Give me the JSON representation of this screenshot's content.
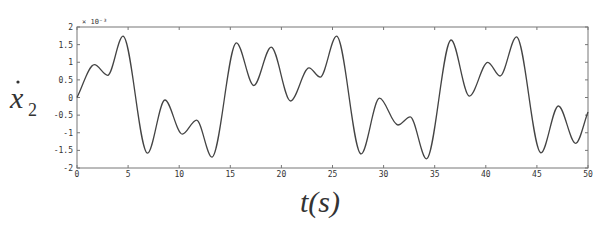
{
  "chart_data": {
    "type": "line",
    "title": "",
    "xlabel": "t(s)",
    "ylabel": "ẋ2",
    "y_exponent_label": "× 10⁻³",
    "xlim": [
      0,
      50
    ],
    "ylim": [
      -2,
      2
    ],
    "grid": false,
    "legend": null,
    "x_ticks": [
      0,
      5,
      10,
      15,
      20,
      25,
      30,
      35,
      40,
      45,
      50
    ],
    "x_tick_labels": [
      "0",
      "5",
      "10",
      "15",
      "20",
      "25",
      "30",
      "35",
      "40",
      "45",
      "50"
    ],
    "y_ticks": [
      2,
      1.5,
      1,
      0.5,
      0,
      -0.5,
      -1,
      -1.5,
      -2
    ],
    "y_tick_labels": [
      "2",
      "1.5",
      "1",
      "0.5",
      "0",
      "-0.5",
      "-1",
      "-1.5",
      "-2"
    ],
    "series": [
      {
        "name": "x2_dot",
        "color": "#444444",
        "x": [
          0,
          1.7,
          3.0,
          4.5,
          6.9,
          8.6,
          10.3,
          11.7,
          13.2,
          15.6,
          17.3,
          19.0,
          20.9,
          22.7,
          23.8,
          25.4,
          27.8,
          29.6,
          31.4,
          32.6,
          34.2,
          36.6,
          38.4,
          40.2,
          41.4,
          43.0,
          45.4,
          47.1,
          48.8,
          50
        ],
        "values": [
          0.0,
          0.93,
          0.63,
          1.74,
          -1.58,
          -0.07,
          -1.04,
          -0.64,
          -1.69,
          1.55,
          0.34,
          1.43,
          -0.1,
          0.84,
          0.58,
          1.74,
          -1.6,
          -0.02,
          -0.78,
          -0.55,
          -1.74,
          1.63,
          0.04,
          1.0,
          0.61,
          1.72,
          -1.57,
          -0.24,
          -1.3,
          -0.41
        ]
      }
    ]
  },
  "labels": {
    "y_axis_symbol": "x",
    "y_axis_subscript": "2",
    "y_axis_dot": "·",
    "x_axis_title": "t(s)",
    "exponent": "× 10⁻³"
  }
}
